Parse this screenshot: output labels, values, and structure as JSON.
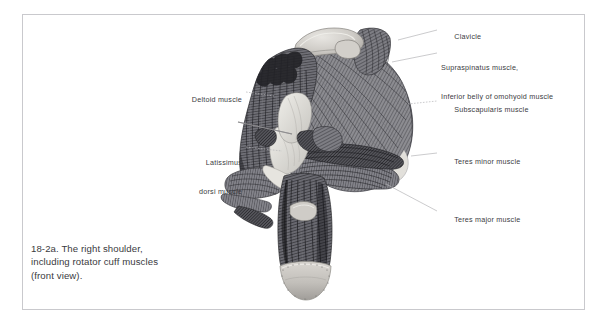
{
  "figure": {
    "caption_lines": [
      "18-2a. The right shoulder,",
      "including rotator cuff muscles",
      "(front view)."
    ],
    "border_color": "#c9c9cd",
    "background_color": "#ffffff",
    "label_color": "#3b3b41",
    "leader_color": "#b4b4b8",
    "illustration_name": "right-shoulder-anterior-anatomical-engraving"
  },
  "labels": {
    "right": [
      {
        "id": "clavicle",
        "lines": [
          "Clavicle"
        ],
        "x": 441,
        "y": 26,
        "leader": {
          "x1": 398,
          "y1": 40,
          "x2": 437,
          "y2": 30
        }
      },
      {
        "id": "supraspinatus",
        "lines": [
          "Supraspinatus muscle,",
          "Inferior belly of omohyoid muscle"
        ],
        "x": 441,
        "y": 48,
        "leader": {
          "x1": 392,
          "y1": 62,
          "x2": 437,
          "y2": 53
        }
      },
      {
        "id": "subscapularis",
        "lines": [
          "Subscapularis muscle"
        ],
        "x": 441,
        "y": 98,
        "leader": {
          "x1": 408,
          "y1": 104,
          "x2": 437,
          "y2": 101
        }
      },
      {
        "id": "teres-minor",
        "lines": [
          "Teres minor muscle"
        ],
        "x": 441,
        "y": 150,
        "leader": {
          "x1": 411,
          "y1": 156,
          "x2": 437,
          "y2": 153
        }
      },
      {
        "id": "teres-major",
        "lines": [
          "Teres major muscle"
        ],
        "x": 441,
        "y": 208,
        "leader": {
          "x1": 386,
          "y1": 184,
          "x2": 437,
          "y2": 211
        }
      }
    ],
    "left": [
      {
        "id": "deltoid",
        "lines": [
          "Deltoid muscle"
        ],
        "x": 164,
        "y": 88,
        "w": 78,
        "leader": {
          "x1": 246,
          "y1": 92,
          "x2": 274,
          "y2": 96
        }
      },
      {
        "id": "latissimus",
        "lines": [
          "Latissimus",
          "dorsi muscle"
        ],
        "x": 164,
        "y": 142,
        "w": 78,
        "leader": {
          "x1": 246,
          "y1": 147,
          "x2": 280,
          "y2": 151
        }
      }
    ]
  }
}
